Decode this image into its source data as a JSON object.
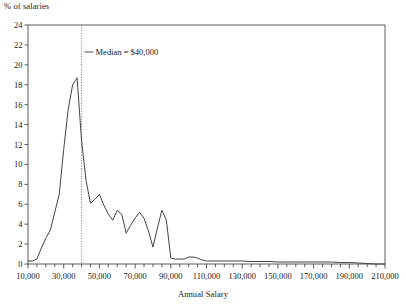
{
  "chart_data": {
    "type": "line",
    "title": "",
    "xlabel": "Annual Salary",
    "ylabel": "% of salaries",
    "xlim": [
      10000,
      210000
    ],
    "ylim": [
      0,
      24
    ],
    "grid": false,
    "legend_position": "inside-top-left",
    "xtick_step": 20000,
    "xtick_minor_step": 5000,
    "ytick_step": 2,
    "xticks": [
      "10,000",
      "30,000",
      "50,000",
      "70,000",
      "90,000",
      "110,000",
      "130,000",
      "150,000",
      "170,000",
      "190,000",
      "210,000"
    ],
    "yticks": [
      "0",
      "2",
      "4",
      "6",
      "8",
      "10",
      "12",
      "14",
      "16",
      "18",
      "20",
      "22",
      "24"
    ],
    "annotations": [
      {
        "name": "median-line",
        "label": "Median = $40,000",
        "value": 40000,
        "style": "dotted-vertical"
      }
    ],
    "series": [
      {
        "name": "salary-distribution",
        "color": "#3a3a3a",
        "x": [
          10000,
          12500,
          15000,
          17500,
          20000,
          22500,
          25000,
          27500,
          30000,
          32500,
          35000,
          37500,
          40000,
          42500,
          45000,
          47500,
          50000,
          52500,
          55000,
          57500,
          60000,
          62500,
          65000,
          67500,
          70000,
          72500,
          75000,
          77500,
          80000,
          82500,
          85000,
          87500,
          90000,
          92500,
          95000,
          97500,
          100000,
          102500,
          105000,
          107500,
          110000,
          115000,
          120000,
          125000,
          130000,
          135000,
          140000,
          145000,
          150000,
          155000,
          160000,
          165000,
          170000,
          175000,
          180000,
          185000,
          190000,
          195000,
          200000,
          205000,
          210000
        ],
        "y": [
          0.3,
          0.3,
          0.5,
          1.6,
          2.6,
          3.4,
          5.2,
          7.0,
          11.5,
          15.5,
          18.0,
          18.7,
          12.4,
          8.4,
          6.1,
          6.5,
          7.0,
          5.9,
          5.0,
          4.4,
          5.4,
          5.0,
          3.1,
          3.9,
          4.6,
          5.2,
          4.6,
          3.3,
          1.7,
          3.6,
          5.4,
          4.4,
          0.6,
          0.5,
          0.5,
          0.5,
          0.7,
          0.7,
          0.6,
          0.4,
          0.3,
          0.3,
          0.3,
          0.3,
          0.3,
          0.25,
          0.25,
          0.25,
          0.2,
          0.2,
          0.2,
          0.2,
          0.2,
          0.2,
          0.2,
          0.15,
          0.15,
          0.1,
          0.05,
          0.0,
          0.0
        ]
      }
    ]
  },
  "legend": {
    "median_label": "Median = $40,000",
    "dash_glyph": "—"
  },
  "axes": {
    "y_axis_title": "% of salaries",
    "x_axis_title": "Annual Salary"
  }
}
